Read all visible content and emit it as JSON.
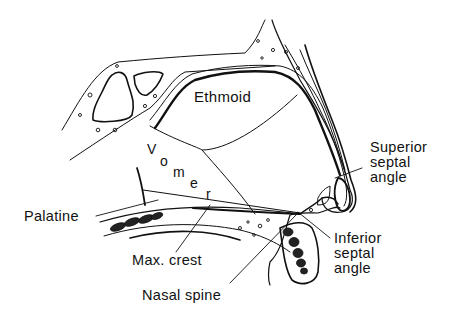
{
  "diagram": {
    "labels": {
      "ethmoid": "Ethmoid",
      "vomer_letters": [
        "V",
        "o",
        "m",
        "e",
        "r"
      ],
      "superior_septal_angle": "Superior\nseptal\nangle",
      "palatine": "Palatine",
      "inferior_septal_angle": "Inferior\nseptal\nangle",
      "max_crest": "Max. crest",
      "nasal_spine": "Nasal spine"
    },
    "colors": {
      "ink": "#111111",
      "background": "#ffffff"
    }
  }
}
